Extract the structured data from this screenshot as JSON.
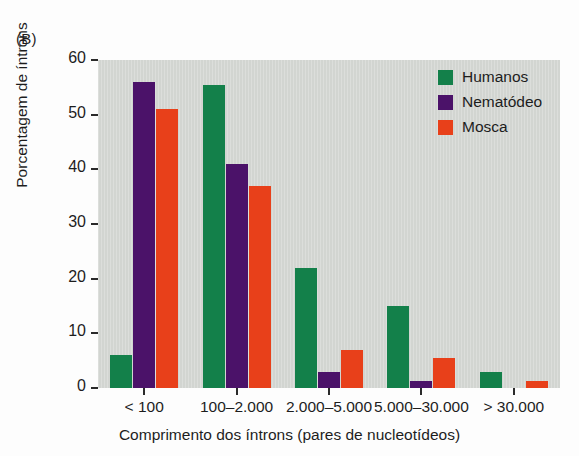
{
  "panel": {
    "label": "(B)"
  },
  "chart_data": {
    "type": "bar",
    "title": "",
    "subtitle": "",
    "xlabel": "Comprimento dos íntrons (pares de nucleotídeos)",
    "ylabel": "Porcentagem de íntrons",
    "categories": [
      "< 100",
      "100–2.000",
      "2.000–5.000",
      "5.000–30.000",
      "> 30.000"
    ],
    "series": [
      {
        "name": "Humanos",
        "color": "#13804a",
        "values": [
          6,
          55.5,
          22,
          15,
          3
        ]
      },
      {
        "name": "Nematódeo",
        "color": "#4b1269",
        "values": [
          56,
          41,
          3,
          1.3,
          0
        ]
      },
      {
        "name": "Mosca",
        "color": "#e8401a",
        "values": [
          51,
          37,
          7,
          5.5,
          1.2
        ]
      }
    ],
    "ylim": [
      0,
      60
    ],
    "yticks": [
      0,
      10,
      20,
      30,
      40,
      50,
      60
    ],
    "xlim_note": "categorical",
    "grid": false,
    "legend_position": "top-right",
    "plot_background": "#d2d5d1",
    "figure_background": "#fdfdfd"
  }
}
